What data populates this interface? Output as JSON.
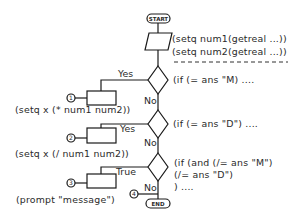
{
  "diagram": {
    "type": "flowchart",
    "terminals": {
      "start": "START",
      "end": "END"
    },
    "input_step": {
      "lines": [
        "(setq num1(getreal ...))",
        "(setq num2(getreal ...))"
      ],
      "separator": "- - - - - - - - - - - - - - -"
    },
    "decisions": [
      {
        "condition_lines": [
          "(if (= ans \"M) ...."
        ],
        "branch_label": "Yes",
        "no_label": "No",
        "process_marker": "1",
        "process_code": "(setq x (* num1 num2))"
      },
      {
        "condition_lines": [
          "(if (= ans \"D\") ...."
        ],
        "branch_label": "Yes",
        "no_label": "No",
        "process_marker": "2",
        "process_code": "(setq x (/ num1 num2))"
      },
      {
        "condition_lines": [
          "(if (and (/= ans \"M\")",
          "(/= ans \"D\")",
          ") ...."
        ],
        "branch_label": "True",
        "no_label": "No",
        "process_marker": "3",
        "process_code": "(prompt \"message\")"
      }
    ],
    "exit_marker": "4",
    "colors": {
      "stroke": "#1a1a1a",
      "text": "#2a2a2a",
      "background": "#ffffff"
    }
  }
}
